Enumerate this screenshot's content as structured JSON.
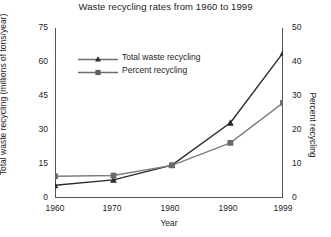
{
  "chart_data": {
    "type": "line",
    "title": "Waste recycling rates from 1960 to 1999",
    "xlabel": "Year",
    "ylabel": "Total waste recycling (millions of tons/year)",
    "ylabel_right": "Percent recycling",
    "x": [
      1960,
      1970,
      1980,
      1990,
      1999
    ],
    "xticklabels": [
      "1960",
      "1970",
      "1980",
      "1990",
      "1999"
    ],
    "xlim": [
      1960,
      1999
    ],
    "ylim": [
      0,
      75
    ],
    "yticks": [
      0,
      15,
      30,
      45,
      60,
      75
    ],
    "yticklabels": [
      "0",
      "15",
      "30",
      "45",
      "60",
      "75"
    ],
    "ylim_right": [
      0,
      50
    ],
    "yticks_right": [
      0,
      10,
      20,
      30,
      40,
      50
    ],
    "yticklabels_right": [
      "0",
      "10",
      "20",
      "30",
      "40",
      "50"
    ],
    "grid": false,
    "legend_position": "upper-left-inside",
    "series": [
      {
        "name": "Total waste recycling",
        "axis": "left",
        "marker": "triangle",
        "color": "#2b2b2b",
        "values": [
          5.6,
          8.0,
          14.5,
          33.2,
          64.0
        ]
      },
      {
        "name": "Percent recycling",
        "axis": "right",
        "marker": "square",
        "color": "#6a6a6a",
        "values": [
          6.4,
          6.6,
          9.6,
          16.2,
          28.0
        ]
      }
    ]
  },
  "legend": {
    "entries": [
      {
        "label": "Total waste recycling"
      },
      {
        "label": "Percent recycling"
      }
    ]
  },
  "axes": {
    "x_tick_0": "1960",
    "x_tick_1": "1970",
    "x_tick_2": "1980",
    "x_tick_3": "1990",
    "x_tick_4": "1999",
    "left_tick_0": "0",
    "left_tick_1": "15",
    "left_tick_2": "30",
    "left_tick_3": "45",
    "left_tick_4": "60",
    "left_tick_5": "75",
    "right_tick_0": "0",
    "right_tick_1": "10",
    "right_tick_2": "20",
    "right_tick_3": "30",
    "right_tick_4": "40",
    "right_tick_5": "50"
  }
}
